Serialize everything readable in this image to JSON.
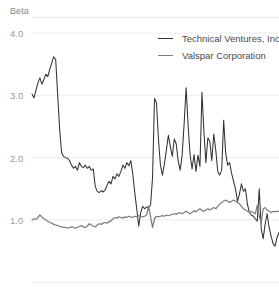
{
  "chart_data": {
    "type": "line",
    "title": "",
    "ylabel": "Beta",
    "xlabel": "",
    "ylim": [
      0.0,
      4.25
    ],
    "yticks": [
      4.0,
      3.0,
      2.0,
      1.0
    ],
    "ytick_labels": [
      "4.0",
      "3.0",
      "2.0",
      "1.0"
    ],
    "grid": true,
    "gridlines_y": [
      4.25,
      4.0,
      3.0,
      2.0,
      1.0,
      0.0
    ],
    "legend_position": "top-right",
    "colors": {
      "series_1": "#333333",
      "series_2": "#7d7d7d",
      "gridline": "#ececec",
      "tick_text": "#9a9a9a",
      "axis_title_text": "#888888",
      "legend_text": "#4a4a4a",
      "background": "#ffffff"
    },
    "series": [
      {
        "name": "Technical Ventures, Inc.",
        "color": "#333333",
        "values": [
          3.02,
          2.96,
          3.08,
          3.2,
          3.28,
          3.18,
          3.25,
          3.34,
          3.3,
          3.42,
          3.52,
          3.62,
          3.57,
          3.0,
          2.45,
          2.08,
          2.02,
          2.0,
          1.99,
          1.95,
          1.88,
          1.83,
          1.86,
          1.8,
          1.92,
          1.86,
          1.84,
          1.88,
          1.83,
          1.86,
          1.8,
          1.82,
          1.54,
          1.46,
          1.44,
          1.47,
          1.45,
          1.48,
          1.56,
          1.62,
          1.58,
          1.7,
          1.66,
          1.74,
          1.7,
          1.78,
          1.88,
          1.83,
          1.92,
          1.87,
          1.95,
          1.74,
          1.44,
          1.18,
          0.9,
          1.12,
          1.22,
          1.18,
          1.21,
          1.2,
          1.24,
          1.68,
          2.95,
          2.88,
          2.3,
          1.88,
          1.72,
          1.9,
          2.12,
          2.36,
          2.18,
          2.02,
          2.3,
          2.22,
          1.94,
          1.8,
          2.05,
          2.55,
          3.12,
          2.52,
          2.05,
          1.82,
          2.05,
          1.78,
          2.04,
          1.86,
          3.05,
          2.42,
          1.92,
          2.32,
          2.26,
          1.95,
          2.38,
          2.12,
          1.78,
          1.72,
          1.8,
          2.6,
          2.08,
          1.88,
          1.92,
          1.75,
          1.62,
          1.5,
          1.3,
          1.42,
          1.58,
          1.46,
          1.5,
          1.26,
          1.12,
          1.08,
          1.06,
          1.02,
          0.98,
          1.5,
          0.86,
          0.7,
          0.94,
          1.1,
          0.88,
          0.74,
          0.62,
          0.58,
          0.72,
          0.8
        ]
      },
      {
        "name": "Valspar Corporation",
        "color": "#7d7d7d",
        "values": [
          1.0,
          1.02,
          1.01,
          1.04,
          1.08,
          1.05,
          1.02,
          1.0,
          0.98,
          0.96,
          0.95,
          0.93,
          0.92,
          0.91,
          0.9,
          0.89,
          0.88,
          0.88,
          0.87,
          0.88,
          0.89,
          0.88,
          0.87,
          0.88,
          0.9,
          0.91,
          0.89,
          0.88,
          0.9,
          0.94,
          0.92,
          0.9,
          0.89,
          0.92,
          0.94,
          0.93,
          0.95,
          0.96,
          0.95,
          0.97,
          0.99,
          1.02,
          1.04,
          1.03,
          1.05,
          1.04,
          1.03,
          1.05,
          1.04,
          1.06,
          1.05,
          1.04,
          1.06,
          1.05,
          1.07,
          1.06,
          1.05,
          1.06,
          1.08,
          1.22,
          1.05,
          0.88,
          1.02,
          1.06,
          1.05,
          1.06,
          1.07,
          1.06,
          1.08,
          1.07,
          1.08,
          1.09,
          1.1,
          1.09,
          1.11,
          1.12,
          1.1,
          1.12,
          1.14,
          1.12,
          1.1,
          1.12,
          1.15,
          1.13,
          1.16,
          1.18,
          1.15,
          1.14,
          1.16,
          1.18,
          1.16,
          1.18,
          1.2,
          1.18,
          1.22,
          1.25,
          1.28,
          1.3,
          1.32,
          1.3,
          1.28,
          1.3,
          1.32,
          1.3,
          1.28,
          1.26,
          1.22,
          1.18,
          1.16,
          1.14,
          1.12,
          1.14,
          1.12,
          1.1,
          1.24,
          1.06,
          0.96,
          1.18,
          1.2,
          1.16,
          1.14,
          1.12,
          1.14,
          1.13,
          1.14,
          1.14
        ]
      }
    ]
  },
  "legend": {
    "items": [
      {
        "label": "Technical Ventures, Inc."
      },
      {
        "label": "Valspar Corporation"
      }
    ]
  }
}
